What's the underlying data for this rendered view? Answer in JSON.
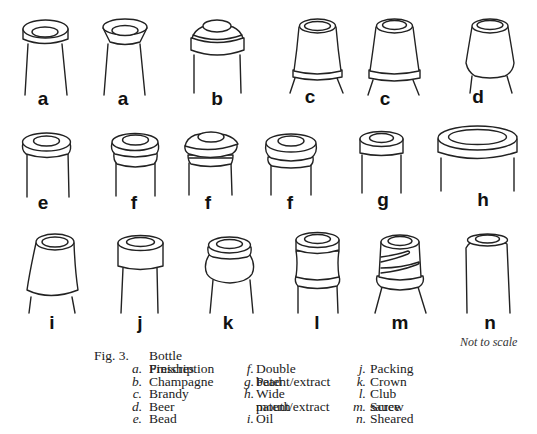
{
  "figure": {
    "title_prefix": "Fig. 3.",
    "title": "Bottle Finishes",
    "note": "Not to scale",
    "drawing_labels": [
      {
        "letter": "a",
        "x": 43,
        "y": 89
      },
      {
        "letter": "a",
        "x": 123,
        "y": 89
      },
      {
        "letter": "b",
        "x": 217,
        "y": 89
      },
      {
        "letter": "c",
        "x": 310,
        "y": 87
      },
      {
        "letter": "c",
        "x": 385,
        "y": 89
      },
      {
        "letter": "d",
        "x": 478,
        "y": 87
      },
      {
        "letter": "e",
        "x": 43,
        "y": 193
      },
      {
        "letter": "f",
        "x": 134,
        "y": 193
      },
      {
        "letter": "f",
        "x": 208,
        "y": 193
      },
      {
        "letter": "f",
        "x": 290,
        "y": 193
      },
      {
        "letter": "g",
        "x": 383,
        "y": 190
      },
      {
        "letter": "h",
        "x": 483,
        "y": 190
      },
      {
        "letter": "i",
        "x": 52,
        "y": 313
      },
      {
        "letter": "j",
        "x": 140,
        "y": 313
      },
      {
        "letter": "k",
        "x": 228,
        "y": 313
      },
      {
        "letter": "l",
        "x": 317,
        "y": 313
      },
      {
        "letter": "m",
        "x": 400,
        "y": 313
      },
      {
        "letter": "n",
        "x": 490,
        "y": 313
      }
    ],
    "legend": {
      "col1": [
        {
          "key": "a.",
          "text": "Prescription"
        },
        {
          "key": "b.",
          "text": "Champagne"
        },
        {
          "key": "c.",
          "text": "Brandy"
        },
        {
          "key": "d.",
          "text": "Beer"
        },
        {
          "key": "e.",
          "text": "Bead"
        }
      ],
      "col2": [
        {
          "key": "f.",
          "text": "Double bead"
        },
        {
          "key": "g.",
          "text": "Patent/extract"
        },
        {
          "key": "h.",
          "text": "Wide mouth"
        },
        {
          "key": "",
          "text": "patent/extract"
        },
        {
          "key": "i.",
          "text": "Oil"
        }
      ],
      "col3": [
        {
          "key": "j.",
          "text": "Packing"
        },
        {
          "key": "k.",
          "text": "Crown"
        },
        {
          "key": "l.",
          "text": "Club sauce"
        },
        {
          "key": "m.",
          "text": "Screw"
        },
        {
          "key": "n.",
          "text": "Sheared"
        }
      ]
    }
  }
}
